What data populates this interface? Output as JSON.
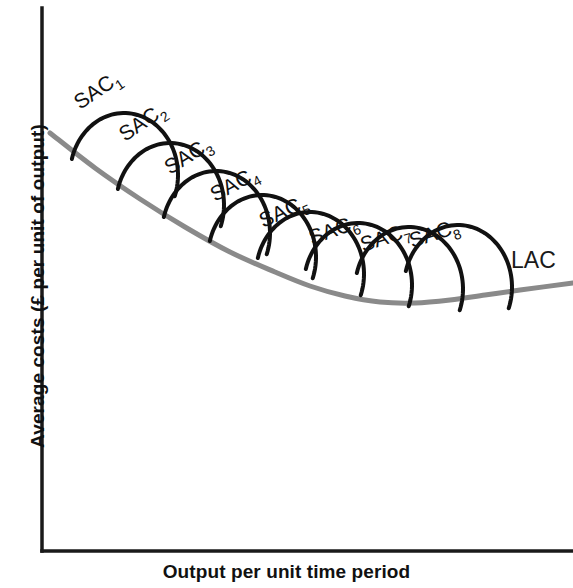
{
  "figure": {
    "background_color": "#ffffff",
    "width": 573,
    "height": 588
  },
  "axes": {
    "x_title": "Output per unit time period",
    "y_title": "Average costs (£ per unit of output)",
    "axis_color": "#1a1a1a",
    "origin": {
      "x": 42,
      "y": 551
    },
    "x_end": 573,
    "y_top": 8
  },
  "chart_data": {
    "type": "line",
    "title": "",
    "xlabel": "Output per unit time period",
    "ylabel": "Average costs (£ per unit of output)",
    "grid": false,
    "legend": "inline-annotations",
    "axis_ticks": {
      "x": [],
      "y": []
    },
    "annotations": [
      {
        "text": "SAC",
        "subscript": "1"
      },
      {
        "text": "SAC",
        "subscript": "2"
      },
      {
        "text": "SAC",
        "subscript": "3"
      },
      {
        "text": "SAC",
        "subscript": "4"
      },
      {
        "text": "SAC",
        "subscript": "5"
      },
      {
        "text": "SAC",
        "subscript": "6"
      },
      {
        "text": "SAC",
        "subscript": "7"
      },
      {
        "text": "SAC",
        "subscript": "8"
      },
      {
        "text": "LAC",
        "subscript": ""
      }
    ],
    "series": [
      {
        "name": "LAC",
        "label": "LAC",
        "role": "long-run-average-cost-envelope",
        "color": "#8a8a8a",
        "stroke_width": 5,
        "shape": "U-shaped envelope",
        "points": [
          [
            50,
            133
          ],
          [
            95,
            168
          ],
          [
            140,
            199
          ],
          [
            185,
            227
          ],
          [
            230,
            252
          ],
          [
            275,
            272
          ],
          [
            310,
            286
          ],
          [
            345,
            296
          ],
          [
            380,
            302
          ],
          [
            415,
            303
          ],
          [
            450,
            300
          ],
          [
            485,
            295
          ],
          [
            520,
            290
          ],
          [
            573,
            283
          ]
        ]
      },
      {
        "name": "SAC1",
        "label": "SAC",
        "subscript": "1",
        "role": "short-run-average-cost",
        "color": "#111111",
        "stroke_width": 4,
        "arc": {
          "cx": 124,
          "cy": 175,
          "rx": 54,
          "ry": 62,
          "start_deg": 195,
          "end_deg": 20
        },
        "label_pos": {
          "x": 80,
          "y": 110
        },
        "label_rotation": -34
      },
      {
        "name": "SAC2",
        "label": "SAC",
        "subscript": "2",
        "role": "short-run-average-cost",
        "color": "#111111",
        "stroke_width": 4,
        "arc": {
          "cx": 170,
          "cy": 205,
          "rx": 54,
          "ry": 62,
          "start_deg": 195,
          "end_deg": 20
        },
        "label_pos": {
          "x": 125,
          "y": 142
        },
        "label_rotation": -34
      },
      {
        "name": "SAC3",
        "label": "SAC",
        "subscript": "3",
        "role": "short-run-average-cost",
        "color": "#111111",
        "stroke_width": 4,
        "arc": {
          "cx": 216,
          "cy": 233,
          "rx": 54,
          "ry": 62,
          "start_deg": 195,
          "end_deg": 20
        },
        "label_pos": {
          "x": 170,
          "y": 175
        },
        "label_rotation": -32
      },
      {
        "name": "SAC4",
        "label": "SAC",
        "subscript": "4",
        "role": "short-run-average-cost",
        "color": "#111111",
        "stroke_width": 4,
        "arc": {
          "cx": 262,
          "cy": 257,
          "rx": 54,
          "ry": 62,
          "start_deg": 195,
          "end_deg": 20
        },
        "label_pos": {
          "x": 215,
          "y": 202
        },
        "label_rotation": -28
      },
      {
        "name": "SAC5",
        "label": "SAC",
        "subscript": "5",
        "role": "short-run-average-cost",
        "color": "#111111",
        "stroke_width": 4,
        "arc": {
          "cx": 310,
          "cy": 274,
          "rx": 54,
          "ry": 62,
          "start_deg": 195,
          "end_deg": 20
        },
        "label_pos": {
          "x": 263,
          "y": 228
        },
        "label_rotation": -24
      },
      {
        "name": "SAC6",
        "label": "SAC",
        "subscript": "6",
        "role": "short-run-average-cost",
        "color": "#111111",
        "stroke_width": 4,
        "arc": {
          "cx": 358,
          "cy": 285,
          "rx": 54,
          "ry": 62,
          "start_deg": 195,
          "end_deg": 20
        },
        "label_pos": {
          "x": 312,
          "y": 245
        },
        "label_rotation": -20
      },
      {
        "name": "SAC7",
        "label": "SAC",
        "subscript": "7",
        "role": "short-run-average-cost",
        "color": "#111111",
        "stroke_width": 4,
        "arc": {
          "cx": 409,
          "cy": 289,
          "rx": 54,
          "ry": 62,
          "start_deg": 195,
          "end_deg": 20
        },
        "label_pos": {
          "x": 363,
          "y": 252
        },
        "label_rotation": -18
      },
      {
        "name": "SAC8",
        "label": "SAC",
        "subscript": "8",
        "role": "short-run-average-cost",
        "color": "#111111",
        "stroke_width": 4,
        "arc": {
          "cx": 458,
          "cy": 287,
          "rx": 54,
          "ry": 62,
          "start_deg": 195,
          "end_deg": 20
        },
        "label_pos": {
          "x": 412,
          "y": 248
        },
        "label_rotation": -18
      }
    ],
    "lac_label_pos": {
      "x": 511,
      "y": 268
    }
  }
}
